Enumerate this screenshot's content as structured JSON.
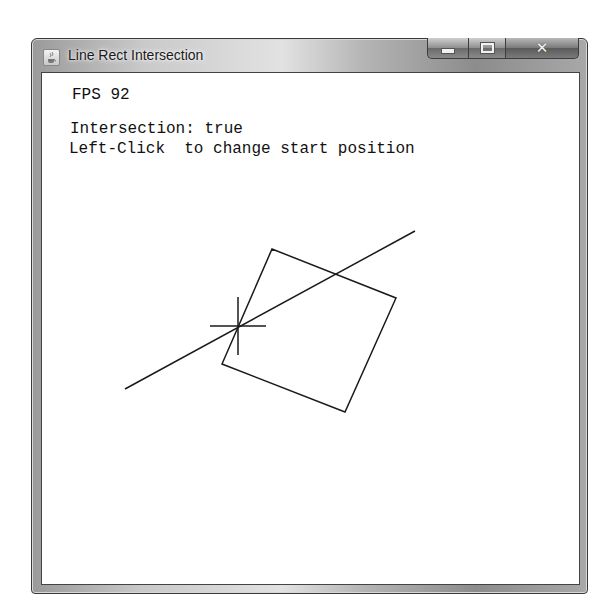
{
  "window": {
    "title": "Line Rect Intersection",
    "icon": "java-cup-icon",
    "controls": {
      "minimize": "minimize-icon",
      "maximize": "maximize-icon",
      "close": "close-icon"
    }
  },
  "canvas": {
    "fps_label": "FPS 92",
    "intersection_label": "Intersection: true",
    "instruction_label": "Left-Click  to change start position",
    "line": {
      "x1": 125,
      "y1": 389,
      "x2": 415,
      "y2": 231
    },
    "rectangle": {
      "points": [
        [
          272,
          249
        ],
        [
          396,
          298
        ],
        [
          345,
          412
        ],
        [
          222,
          364
        ]
      ]
    },
    "crosshair": {
      "x": 238,
      "y": 326,
      "half_width": 28,
      "half_height": 29
    },
    "stroke_color": "#1a1a1a"
  }
}
